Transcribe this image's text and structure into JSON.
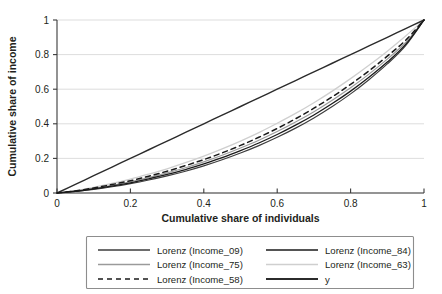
{
  "chart_data": {
    "type": "line",
    "title": "",
    "xlabel": "Cumulative share of individuals",
    "ylabel": "Cumulative share of income",
    "xlim": [
      0,
      1
    ],
    "ylim": [
      0,
      1
    ],
    "xticks": [
      "0",
      "0.2",
      "0.4",
      "0.6",
      "0.8",
      "1"
    ],
    "yticks": [
      "0",
      "0.2",
      "0.4",
      "0.6",
      "0.8",
      "1"
    ],
    "xtick_values": [
      0,
      0.2,
      0.4,
      0.6,
      0.8,
      1
    ],
    "ytick_values": [
      0,
      0.2,
      0.4,
      0.6,
      0.8,
      1
    ],
    "grid": "horizontal",
    "legend_position": "below-plot",
    "legend_columns": 2,
    "x": [
      0,
      0.05,
      0.1,
      0.15,
      0.2,
      0.25,
      0.3,
      0.35,
      0.4,
      0.45,
      0.5,
      0.55,
      0.6,
      0.65,
      0.7,
      0.75,
      0.8,
      0.85,
      0.9,
      0.95,
      1
    ],
    "series": [
      {
        "name": "Lorenz (Income_09)",
        "color": "#3d3d3d",
        "width": 1.15,
        "dash": "none",
        "gini": 0.404,
        "values": [
          0,
          0.009,
          0.021,
          0.036,
          0.054,
          0.075,
          0.099,
          0.126,
          0.157,
          0.192,
          0.231,
          0.274,
          0.322,
          0.375,
          0.434,
          0.5,
          0.573,
          0.655,
          0.746,
          0.852,
          1
        ]
      },
      {
        "name": "Lorenz (Income_75)",
        "color": "#9a9a9a",
        "width": 1.15,
        "dash": "none",
        "gini": 0.372,
        "values": [
          0,
          0.011,
          0.026,
          0.044,
          0.065,
          0.089,
          0.116,
          0.146,
          0.18,
          0.218,
          0.26,
          0.305,
          0.355,
          0.41,
          0.47,
          0.536,
          0.608,
          0.687,
          0.774,
          0.87,
          1
        ]
      },
      {
        "name": "Lorenz (Income_58)",
        "color": "#1a1a1a",
        "width": 1.5,
        "dash": "5,4",
        "gini": 0.355,
        "values": [
          0,
          0.012,
          0.029,
          0.049,
          0.071,
          0.097,
          0.126,
          0.158,
          0.193,
          0.232,
          0.275,
          0.322,
          0.373,
          0.429,
          0.49,
          0.556,
          0.628,
          0.706,
          0.791,
          0.883,
          1
        ]
      },
      {
        "name": "Lorenz (Income_84)",
        "color": "#1a1a1a",
        "width": 1.3,
        "dash": "none",
        "gini": 0.386,
        "values": [
          0,
          0.01,
          0.024,
          0.04,
          0.059,
          0.082,
          0.107,
          0.135,
          0.168,
          0.204,
          0.245,
          0.289,
          0.338,
          0.392,
          0.451,
          0.517,
          0.589,
          0.669,
          0.757,
          0.859,
          1
        ]
      },
      {
        "name": "Lorenz (Income_63)",
        "color": "#cfcfcf",
        "width": 1.3,
        "dash": "none",
        "gini": 0.33,
        "values": [
          0,
          0.014,
          0.033,
          0.055,
          0.08,
          0.109,
          0.14,
          0.175,
          0.213,
          0.255,
          0.3,
          0.349,
          0.403,
          0.46,
          0.522,
          0.589,
          0.661,
          0.738,
          0.82,
          0.908,
          1
        ]
      },
      {
        "name": "y",
        "color": "#2b2b2b",
        "width": 1.4,
        "dash": "none",
        "gini": 0,
        "values": [
          0,
          0.05,
          0.1,
          0.15,
          0.2,
          0.25,
          0.3,
          0.35,
          0.4,
          0.45,
          0.5,
          0.55,
          0.6,
          0.65,
          0.7,
          0.75,
          0.8,
          0.85,
          0.9,
          0.95,
          1
        ]
      }
    ],
    "legend_entries": [
      {
        "label": "Lorenz (Income_09)",
        "color": "#3d3d3d",
        "width": 1.3,
        "dash": "none"
      },
      {
        "label": "Lorenz (Income_84)",
        "color": "#1a1a1a",
        "width": 1.7,
        "dash": "none"
      },
      {
        "label": "Lorenz (Income_75)",
        "color": "#9a9a9a",
        "width": 1.3,
        "dash": "none"
      },
      {
        "label": "Lorenz (Income_63)",
        "color": "#cfcfcf",
        "width": 1.7,
        "dash": "none"
      },
      {
        "label": "Lorenz (Income_58)",
        "color": "#1a1a1a",
        "width": 1.7,
        "dash": "5,4"
      },
      {
        "label": "y",
        "color": "#2b2b2b",
        "width": 1.8,
        "dash": "none"
      }
    ]
  }
}
